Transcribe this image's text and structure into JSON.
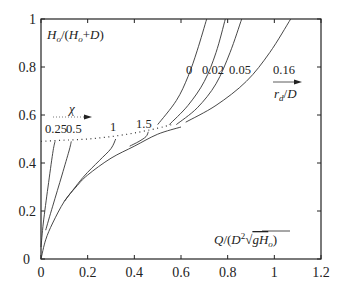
{
  "chart_data": {
    "type": "line",
    "title": "",
    "xlabel": "Q/(D^2 sqrt(g H_o))",
    "ylabel": "H_o/(H_o+D)",
    "xlim": [
      0,
      1.2
    ],
    "ylim": [
      0,
      1
    ],
    "x_ticks": [
      "0",
      "0.2",
      "0.4",
      "0.6",
      "0.8",
      "1",
      "1.2"
    ],
    "y_ticks": [
      "0",
      "0.2",
      "0.4",
      "0.6",
      "0.8",
      "1"
    ],
    "grid": false,
    "legend": "none",
    "annotations": {
      "chi_arrow_label": "χ",
      "rd_arrow_label": "r_d/D"
    },
    "series": [
      {
        "name": "envelope",
        "style": "solid",
        "x": [
          0,
          0.02,
          0.05,
          0.1,
          0.15,
          0.2,
          0.3,
          0.4,
          0.5,
          0.6
        ],
        "y": [
          0,
          0.08,
          0.15,
          0.24,
          0.3,
          0.35,
          0.42,
          0.47,
          0.52,
          0.55
        ]
      },
      {
        "name": "dotted boundary",
        "style": "dotted",
        "x": [
          0,
          0.1,
          0.2,
          0.3,
          0.4,
          0.5,
          0.56
        ],
        "y": [
          0.49,
          0.495,
          0.5,
          0.51,
          0.525,
          0.545,
          0.56
        ]
      },
      {
        "name": "χ = 0.25",
        "label": "0.25",
        "style": "solid",
        "x": [
          0,
          0.01,
          0.03,
          0.05,
          0.06
        ],
        "y": [
          0.05,
          0.15,
          0.3,
          0.44,
          0.49
        ]
      },
      {
        "name": "χ = 0.5",
        "label": "0.5",
        "style": "solid",
        "x": [
          0.02,
          0.05,
          0.09,
          0.12,
          0.13
        ],
        "y": [
          0.12,
          0.22,
          0.35,
          0.45,
          0.49
        ]
      },
      {
        "name": "χ = 1",
        "label": "1",
        "style": "solid",
        "x": [
          0.1,
          0.18,
          0.25,
          0.3,
          0.32
        ],
        "y": [
          0.24,
          0.34,
          0.41,
          0.46,
          0.5
        ]
      },
      {
        "name": "χ = 1.5",
        "label": "1.5",
        "style": "solid",
        "x": [
          0.38,
          0.42,
          0.45,
          0.46
        ],
        "y": [
          0.47,
          0.49,
          0.51,
          0.53
        ]
      },
      {
        "name": "r_d/D = 0",
        "label": "0",
        "style": "solid",
        "x": [
          0.5,
          0.58,
          0.63,
          0.67,
          0.71
        ],
        "y": [
          0.56,
          0.66,
          0.76,
          0.87,
          1.0
        ]
      },
      {
        "name": "r_d/D = 0.02",
        "label": "0.02",
        "style": "solid",
        "x": [
          0.55,
          0.63,
          0.7,
          0.75,
          0.79
        ],
        "y": [
          0.56,
          0.64,
          0.74,
          0.86,
          1.0
        ]
      },
      {
        "name": "r_d/D = 0.05",
        "label": "0.05",
        "style": "solid",
        "x": [
          0.58,
          0.67,
          0.75,
          0.81,
          0.86
        ],
        "y": [
          0.56,
          0.63,
          0.73,
          0.86,
          1.0
        ]
      },
      {
        "name": "r_d/D = 0.16",
        "label": "0.16",
        "style": "solid",
        "x": [
          0.62,
          0.75,
          0.88,
          0.98,
          1.07
        ],
        "y": [
          0.57,
          0.64,
          0.74,
          0.86,
          1.0
        ]
      }
    ],
    "chi_labels": [
      "0.25",
      "0.5",
      "1",
      "1.5"
    ],
    "rd_labels": [
      "0",
      "0.02",
      "0.05",
      "0.16"
    ]
  },
  "labels": {
    "y_axis_title": "H",
    "y_axis_sub": "o",
    "y_axis_rest": "/(H",
    "y_axis_sub2": "o",
    "y_axis_end": "+D)",
    "x_axis_prefix": "Q/(D",
    "x_axis_sup": "2",
    "x_axis_radicand": "gH",
    "x_axis_sub": "o",
    "x_axis_end": ")",
    "chi": "χ",
    "rd": "r",
    "rd_sub": "d",
    "rd_end": "/D"
  }
}
